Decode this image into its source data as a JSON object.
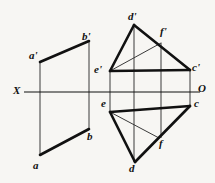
{
  "drawing": {
    "title": "Orthographic projection of two plane figures",
    "type": "descriptive-geometry",
    "canvas": {
      "width": 215,
      "height": 183
    },
    "background_color": "#f7f6f3",
    "ink_color": "#111111",
    "thin_color": "#3a3a3a",
    "ground_line": {
      "name": "X-O axis",
      "y": 92,
      "x_start": 24,
      "x_end": 200,
      "left_label": "X",
      "right_label": "O"
    },
    "labels": [
      {
        "id": "a-prime",
        "text": "a'",
        "x": 29,
        "y": 50
      },
      {
        "id": "b-prime",
        "text": "b'",
        "x": 82,
        "y": 31
      },
      {
        "id": "a",
        "text": "a",
        "x": 33,
        "y": 160
      },
      {
        "id": "b",
        "text": "b",
        "x": 87,
        "y": 131
      },
      {
        "id": "d-prime",
        "text": "d'",
        "x": 128,
        "y": 11
      },
      {
        "id": "f-prime",
        "text": "f'",
        "x": 160,
        "y": 26
      },
      {
        "id": "e-prime",
        "text": "e'",
        "x": 94,
        "y": 64
      },
      {
        "id": "c-prime",
        "text": "c'",
        "x": 192,
        "y": 62
      },
      {
        "id": "e",
        "text": "e",
        "x": 101,
        "y": 98
      },
      {
        "id": "c",
        "text": "c",
        "x": 194,
        "y": 98
      },
      {
        "id": "f",
        "text": "f",
        "x": 159,
        "y": 138
      },
      {
        "id": "d",
        "text": "d",
        "x": 129,
        "y": 163
      }
    ],
    "points": {
      "a_prime": {
        "x": 40,
        "y": 62
      },
      "b_prime": {
        "x": 89,
        "y": 41
      },
      "a": {
        "x": 40,
        "y": 155
      },
      "b": {
        "x": 89,
        "y": 129
      },
      "d_prime": {
        "x": 134,
        "y": 25
      },
      "f_prime": {
        "x": 161,
        "y": 43
      },
      "e_prime": {
        "x": 110,
        "y": 71
      },
      "c_prime": {
        "x": 190,
        "y": 70
      },
      "e": {
        "x": 110,
        "y": 112
      },
      "c": {
        "x": 190,
        "y": 106
      },
      "f": {
        "x": 159,
        "y": 138
      },
      "d": {
        "x": 135,
        "y": 162
      }
    },
    "thick_edges": [
      {
        "id": "edge-a-prime-b-prime",
        "from": "a_prime",
        "to": "b_prime"
      },
      {
        "id": "edge-a-b",
        "from": "a",
        "to": "b"
      },
      {
        "id": "edge-d-prime-e-prime",
        "from": "d_prime",
        "to": "e_prime"
      },
      {
        "id": "edge-d-prime-c-prime",
        "from": "d_prime",
        "to": "c_prime"
      },
      {
        "id": "edge-e-prime-c-prime",
        "from": "e_prime",
        "to": "c_prime"
      },
      {
        "id": "edge-e-c",
        "from": "e",
        "to": "c"
      },
      {
        "id": "edge-e-d",
        "from": "e",
        "to": "d"
      },
      {
        "id": "edge-d-c",
        "from": "d",
        "to": "c"
      }
    ],
    "thin_edges": [
      {
        "id": "aux-e-prime-f-prime",
        "from": "e_prime",
        "to": "f_prime"
      },
      {
        "id": "aux-e-f",
        "from": "e",
        "to": "f"
      }
    ],
    "projection_lines": [
      {
        "id": "proj-a",
        "x": 40,
        "y1": 62,
        "y2": 155
      },
      {
        "id": "proj-b",
        "x": 89,
        "y1": 41,
        "y2": 129
      },
      {
        "id": "proj-e",
        "x": 110,
        "y1": 71,
        "y2": 112
      },
      {
        "id": "proj-d",
        "x": 134,
        "y1": 25,
        "y2": 162
      },
      {
        "id": "proj-f",
        "x": 161,
        "y1": 43,
        "y2": 138
      },
      {
        "id": "proj-c",
        "x": 190,
        "y1": 70,
        "y2": 106
      }
    ]
  }
}
